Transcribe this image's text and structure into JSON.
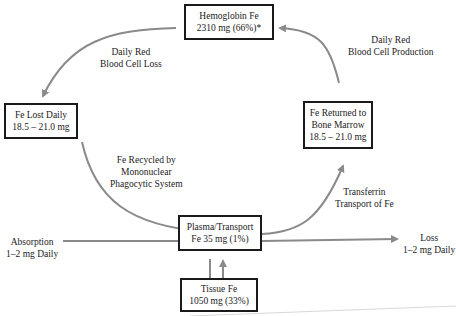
{
  "diagram": {
    "nodes": {
      "hemoglobin": {
        "line1": "Hemoglobin Fe",
        "line2": "2310 mg (66%)*"
      },
      "fe_lost": {
        "line1": "Fe Lost Daily",
        "line2": "18.5 – 21.0 mg"
      },
      "fe_returned": {
        "line1": "Fe Returned to",
        "line2": "Bone Marrow",
        "line3": "18.5 – 21.0 mg"
      },
      "plasma": {
        "line1": "Plasma/Transport",
        "line2": "Fe 35 mg (1%)"
      },
      "tissue": {
        "line1": "Tissue Fe",
        "line2": "1050 mg (33%)"
      }
    },
    "edge_labels": {
      "rbc_loss": {
        "line1": "Daily Red",
        "line2": "Blood Cell Loss"
      },
      "rbc_production": {
        "line1": "Daily Red",
        "line2": "Blood Cell Production"
      },
      "recycled": {
        "line1": "Fe Recycled by",
        "line2": "Mononuclear",
        "line3": "Phagocytic System"
      },
      "transferrin": {
        "line1": "Transferrin",
        "line2": "Transport of Fe"
      },
      "absorption": {
        "line1": "Absorption",
        "line2": "1–2 mg Daily"
      },
      "loss": {
        "line1": "Loss",
        "line2": "1–2 mg Daily"
      }
    },
    "colors": {
      "arrow": "#8a8a8a",
      "box_border": "#1a1a1a",
      "text": "#1a1a1a"
    }
  }
}
